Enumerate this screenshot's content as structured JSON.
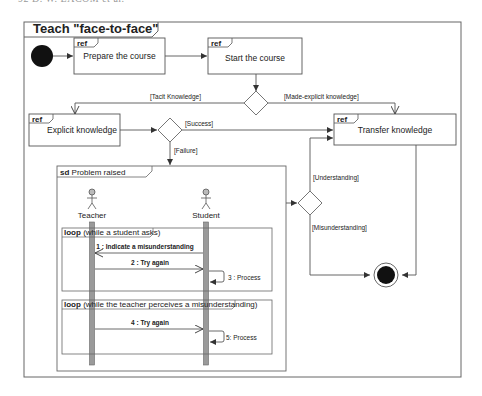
{
  "page_header_fragment": "92      D. W. LACOM  et al.",
  "diagram": {
    "title": "Teach \"face-to-face\"",
    "initial_node": "initial-node",
    "final_node": "activity-final-node",
    "ref_tag": "ref",
    "actions": [
      {
        "id": "prepare",
        "label": "Prepare the course"
      },
      {
        "id": "start",
        "label": "Start the course"
      },
      {
        "id": "explicit",
        "label": "Explicit knowledge"
      },
      {
        "id": "transfer",
        "label": "Transfer knowledge"
      }
    ],
    "guards": {
      "tacit": "[Tacit Knowledge]",
      "made_explicit": "[Made-explicit knowledge]",
      "success": "[Success]",
      "failure": "[Failure]",
      "understanding": "[Understanding]",
      "misunderstanding": "[Misunderstanding]"
    },
    "sequence": {
      "tag": "sd",
      "title": "Problem raised",
      "lifelines": [
        {
          "id": "teacher",
          "label": "Teacher"
        },
        {
          "id": "student",
          "label": "Student"
        }
      ],
      "loops": [
        {
          "tag": "loop",
          "condition": "(while a student asks)",
          "messages": [
            {
              "label": "1 : Indicate a misunderstanding",
              "from": "student",
              "to": "teacher"
            },
            {
              "label": "2 : Try again",
              "from": "teacher",
              "to": "student"
            },
            {
              "label": "3 : Process",
              "from": "student",
              "to": "student"
            }
          ]
        },
        {
          "tag": "loop",
          "condition": "(while the teacher perceives a misunderstanding)",
          "messages": [
            {
              "label": "4 : Try again",
              "from": "teacher",
              "to": "student"
            },
            {
              "label": "5: Process",
              "from": "student",
              "to": "student"
            }
          ]
        }
      ]
    }
  },
  "colors": {
    "line": "#555555",
    "frame": "#666666",
    "lifeline_bar": "#9a9a9a",
    "node_fill": "#111111",
    "background": "#ffffff"
  }
}
